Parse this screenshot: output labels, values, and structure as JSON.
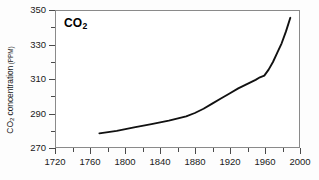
{
  "chart_data": {
    "type": "line",
    "title": "CO2",
    "title_display": "CO₂",
    "xlabel": "",
    "ylabel": "CO2 concentration (PPM)",
    "ylabel_main": "CO₂ concentration",
    "ylabel_unit": "(PPM)",
    "xlim": [
      1720,
      2000
    ],
    "ylim": [
      270,
      350
    ],
    "x_major_step": 40,
    "x_minor_step": 20,
    "y_major_step": 20,
    "y_minor_step": 10,
    "grid": false,
    "legend": "none",
    "line_color": "#111111",
    "frame_color": "#8a8a8a",
    "background": "#ffffff",
    "xticks": [
      1720,
      1760,
      1800,
      1840,
      1880,
      1920,
      1960,
      2000
    ],
    "xtick_labels": [
      "1720",
      "1760",
      "1800",
      "1840",
      "1880",
      "1920",
      "1960",
      "2000"
    ],
    "yticks": [
      270,
      290,
      310,
      330,
      350
    ],
    "ytick_labels": [
      "270",
      "290",
      "310",
      "330",
      "350"
    ],
    "yticks_minor": [
      280,
      300,
      320,
      340
    ],
    "series": [
      {
        "name": "Atmospheric CO2 concentration",
        "x": [
          1770,
          1790,
          1810,
          1830,
          1850,
          1870,
          1880,
          1890,
          1900,
          1910,
          1920,
          1930,
          1940,
          1950,
          1955,
          1960,
          1965,
          1970,
          1975,
          1980,
          1985,
          1990
        ],
        "values": [
          278.0,
          279.5,
          281.5,
          283.5,
          285.5,
          288.0,
          290.0,
          292.5,
          295.5,
          298.5,
          301.5,
          304.5,
          307.0,
          309.5,
          311.0,
          312.0,
          315.5,
          320.0,
          325.5,
          331.0,
          338.0,
          346.0
        ]
      }
    ]
  }
}
